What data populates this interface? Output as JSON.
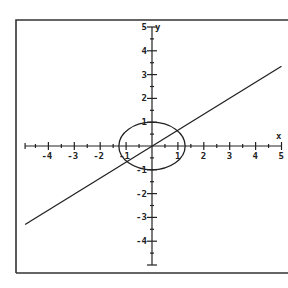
{
  "chart_data": {
    "type": "line",
    "title": "",
    "xlabel": "x",
    "ylabel": "y",
    "xlim": [
      -5,
      5
    ],
    "ylim": [
      -5,
      5
    ],
    "grid": false,
    "legend": null,
    "x_ticks": [
      -4,
      -3,
      -2,
      -1,
      1,
      2,
      3,
      4,
      5
    ],
    "y_ticks": [
      5,
      4,
      3,
      2,
      1,
      -1,
      -2,
      -3,
      -4
    ],
    "x_tick_labels": [
      "-4",
      "-3",
      "-2",
      "-1",
      "1",
      "2",
      "3",
      "4",
      "5"
    ],
    "y_tick_labels": [
      "5",
      "4",
      "3",
      "2",
      "1",
      "-1",
      "-2",
      "-3",
      "-4"
    ],
    "series": [
      {
        "name": "line",
        "kind": "line",
        "equation": "y = 0.67x",
        "x": [
          -4.9,
          5.0
        ],
        "y": [
          -3.3,
          3.35
        ]
      },
      {
        "name": "ellipse",
        "kind": "ellipse",
        "center": [
          0,
          0
        ],
        "semi_axis_x": 1.28,
        "semi_axis_y": 1.0
      }
    ],
    "intersections": [
      [
        1.0,
        0.7
      ],
      [
        -1.0,
        -0.7
      ]
    ]
  },
  "colors": {
    "stroke": "#222222",
    "frame": "#333333",
    "background": "#ffffff"
  }
}
